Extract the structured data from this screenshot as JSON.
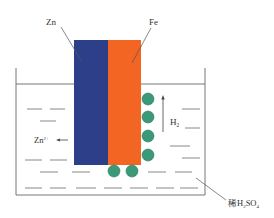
{
  "diagram": {
    "type": "galvanic-cell",
    "labels": {
      "zinc": "Zn",
      "iron": "Fe",
      "hydrogen": "H",
      "hydrogen_sub": "2",
      "zinc_ion": "Zn",
      "zinc_ion_sup": "2+",
      "acid_prefix": "稀H",
      "acid_sub1": "2",
      "acid_mid": "SO",
      "acid_sub2": "4"
    },
    "colors": {
      "zinc": "#2e3f8a",
      "iron": "#f26522",
      "bubble": "#3a9a78",
      "line": "#555555"
    }
  }
}
